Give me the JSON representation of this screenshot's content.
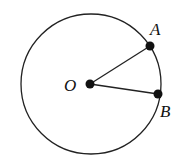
{
  "diagram": {
    "type": "circle-with-radii",
    "circle": {
      "center": [
        91,
        84
      ],
      "radius": 70,
      "stroke": "#222222"
    },
    "points": [
      {
        "id": "O",
        "label": "O",
        "x": 90,
        "y": 84,
        "label_x": 64,
        "label_y": 91
      },
      {
        "id": "A",
        "label": "A",
        "x": 150,
        "y": 46,
        "label_x": 150,
        "label_y": 35
      },
      {
        "id": "B",
        "label": "B",
        "x": 158,
        "y": 94,
        "label_x": 160,
        "label_y": 117
      }
    ],
    "segments": [
      {
        "from": "O",
        "to": "A"
      },
      {
        "from": "O",
        "to": "B"
      }
    ]
  }
}
